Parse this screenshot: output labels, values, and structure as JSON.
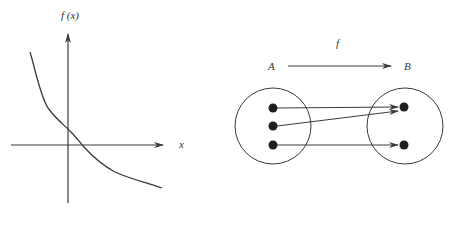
{
  "graph": {
    "y_axis_label": "f (x)",
    "x_axis_label": "x",
    "curve_description": "decreasing curve crossing y-axis above origin and x-axis right of origin"
  },
  "mapping": {
    "function_label": "f",
    "domain_label": "A",
    "codomain_label": "B",
    "domain_elements": 3,
    "codomain_elements": 2,
    "arrows": [
      {
        "from": 1,
        "to": 1
      },
      {
        "from": 2,
        "to": 1
      },
      {
        "from": 3,
        "to": 2
      }
    ]
  },
  "colors": {
    "line": "#3a3a3a",
    "dot": "#1e1e1e",
    "background": "#ffffff"
  }
}
